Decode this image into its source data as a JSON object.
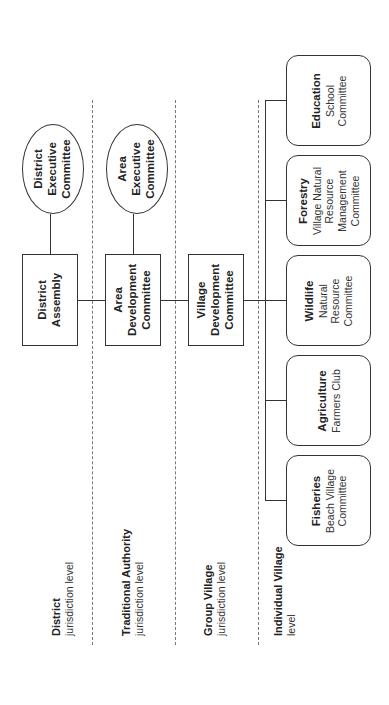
{
  "diagram": {
    "orientation": "rotated 90 degrees counter-clockwise",
    "levels": [
      {
        "title": "District",
        "subtitle": "jurisdiction level"
      },
      {
        "title": "Traditional Authority",
        "subtitle": "jurisdiction level"
      },
      {
        "title": "Group Village",
        "subtitle": "jurisdiction level"
      },
      {
        "title": "Individual Village",
        "subtitle": "level"
      }
    ],
    "main_chain": [
      {
        "id": "district_assembly",
        "lines": [
          "District",
          "Assembly"
        ]
      },
      {
        "id": "area_development_committee",
        "lines": [
          "Area",
          "Development",
          "Committee"
        ]
      },
      {
        "id": "village_development_committee",
        "lines": [
          "Village",
          "Development",
          "Committee"
        ]
      }
    ],
    "executive_committees": [
      {
        "id": "district_executive_committee",
        "attached_to": "district_assembly",
        "lines": [
          "District",
          "Executive",
          "Committee"
        ]
      },
      {
        "id": "area_executive_committee",
        "attached_to": "area_development_committee",
        "lines": [
          "Area",
          "Executive",
          "Committee"
        ]
      }
    ],
    "sectors": [
      {
        "sector": "Education",
        "committee_lines": [
          "School",
          "Committee"
        ]
      },
      {
        "sector": "Forestry",
        "committee_lines": [
          "Village Natural",
          "Resource",
          "Management",
          "Committee"
        ]
      },
      {
        "sector": "Wildlife",
        "committee_lines": [
          "Natural",
          "Resource",
          "Committee"
        ]
      },
      {
        "sector": "Agriculture",
        "committee_lines": [
          "Farmers Club"
        ]
      },
      {
        "sector": "Fisheries",
        "committee_lines": [
          "Beach Village",
          "Committee"
        ]
      }
    ],
    "colors": {
      "line": "#333333",
      "dashed_divider": "#777777",
      "background": "#ffffff"
    }
  }
}
